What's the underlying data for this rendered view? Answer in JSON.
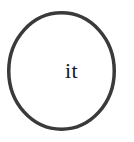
{
  "canvas": {
    "width": 134,
    "height": 142,
    "background_color": "#ffffff"
  },
  "diagram": {
    "title": "it",
    "node": {
      "label": "it",
      "shape": "ellipse",
      "shape_icon": "circle-outline-icon",
      "center_x": 61.5,
      "center_y": 71,
      "radius_x": 54.5,
      "radius_y": 60,
      "stroke_color": "#3a3a3a",
      "stroke_width": 3.5,
      "fill_color": "none",
      "text_color": "#1a1a1a",
      "font_size": "22px"
    }
  }
}
